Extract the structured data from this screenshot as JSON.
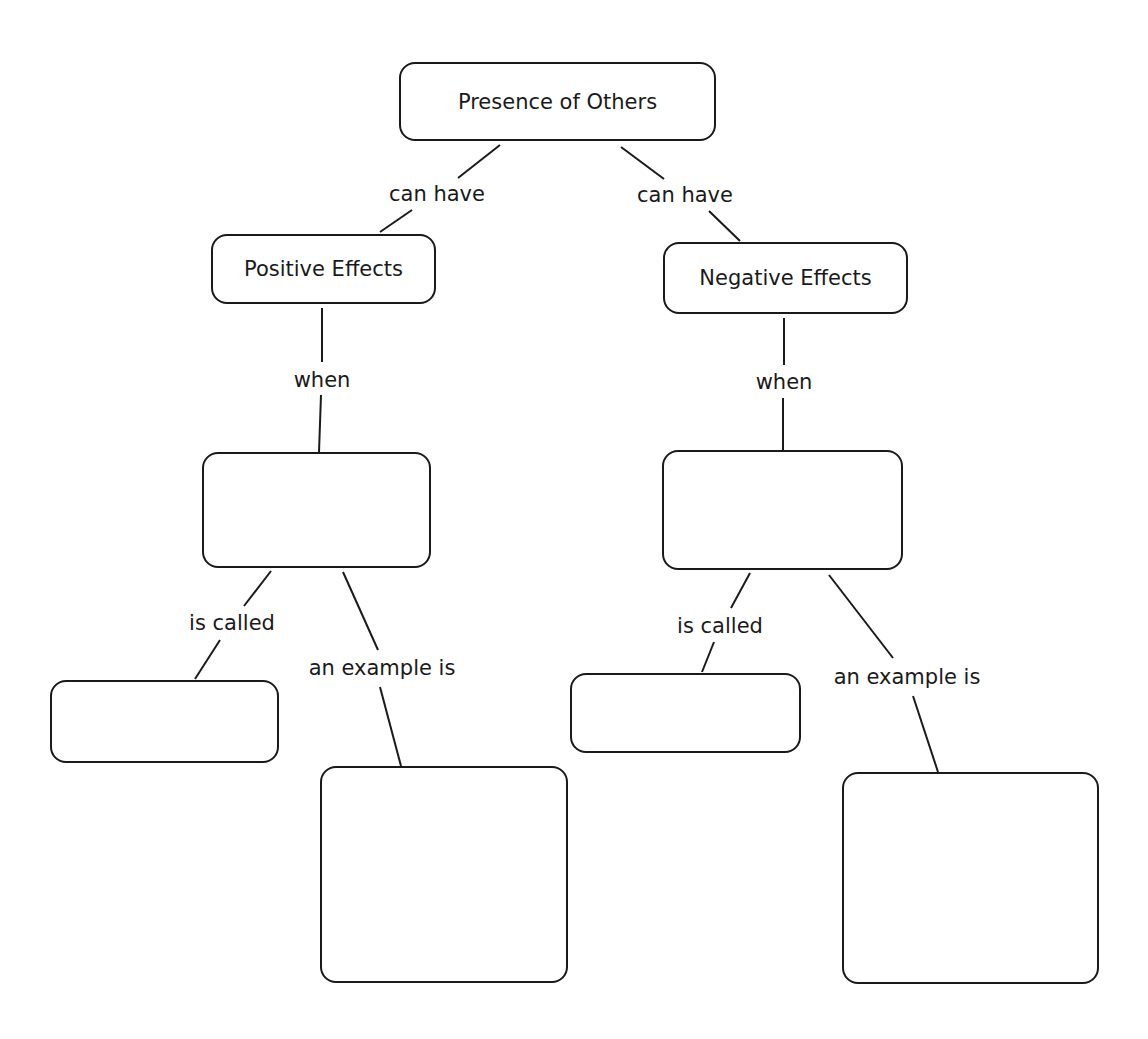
{
  "diagram": {
    "type": "concept-map",
    "nodes": [
      {
        "id": "root",
        "text": "Presence of Others"
      },
      {
        "id": "positive",
        "text": "Positive Effects"
      },
      {
        "id": "negative",
        "text": "Negative Effects"
      },
      {
        "id": "pos_when",
        "text": ""
      },
      {
        "id": "neg_when",
        "text": ""
      },
      {
        "id": "pos_called",
        "text": ""
      },
      {
        "id": "pos_example",
        "text": ""
      },
      {
        "id": "neg_called",
        "text": ""
      },
      {
        "id": "neg_example",
        "text": ""
      }
    ],
    "links": [
      {
        "from": "root",
        "to": "positive",
        "label": "can have"
      },
      {
        "from": "root",
        "to": "negative",
        "label": "can have"
      },
      {
        "from": "positive",
        "to": "pos_when",
        "label": "when"
      },
      {
        "from": "negative",
        "to": "neg_when",
        "label": "when"
      },
      {
        "from": "pos_when",
        "to": "pos_called",
        "label": "is called"
      },
      {
        "from": "pos_when",
        "to": "pos_example",
        "label": "an example is"
      },
      {
        "from": "neg_when",
        "to": "neg_called",
        "label": "is called"
      },
      {
        "from": "neg_when",
        "to": "neg_example",
        "label": "an example is"
      }
    ]
  }
}
